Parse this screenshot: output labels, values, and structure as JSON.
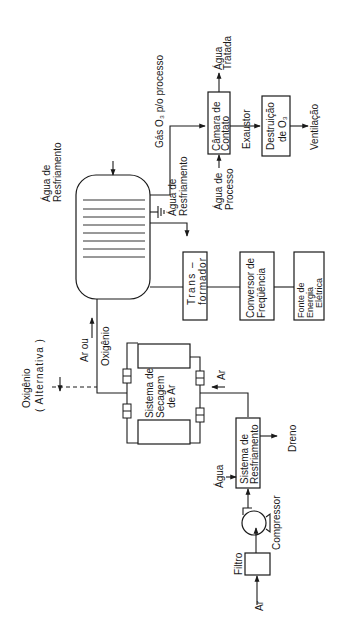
{
  "diagram": {
    "title": "",
    "orientation": "rotated-90-ccw",
    "nodes": {
      "ar_inlet": "Ar",
      "filtro": "Filtro",
      "compressor": "Compressor",
      "agua_inlet": "Água",
      "resfriamento_l1": "Sistema de",
      "resfriamento_l2": "Resfriamento",
      "dreno": "Dreno",
      "ar_flow": "Ar",
      "secagem_l1": "Sistema de",
      "secagem_l2": "Secagem",
      "secagem_l3": "de Ar",
      "oxigenio_l1": "Oxigênio",
      "oxigenio_l2": "( Alternativa )",
      "ar_ou": "Ar ou",
      "oxigenio_flow": "Oxigênio",
      "agua_resfr_in_l1": "Água de",
      "agua_resfr_in_l2": "Resfriamento",
      "agua_resfr_out_l1": "Água de",
      "agua_resfr_out_l2": "Resfriamento",
      "gas_o3": "Gás O₃ p/o processo",
      "agua_processo_l1": "Água de",
      "agua_processo_l2": "Processo",
      "camara_l1": "Câmara  de",
      "camara_l2": "Contato",
      "agua_tratada_l1": "Água",
      "agua_tratada_l2": "Tratada",
      "exaustor": "Exaustor",
      "destruicao_l1": "Destruição",
      "destruicao_l2": "de  O₃",
      "ventilacao": "Ventilação",
      "transformador_l1": "Trans –",
      "transformador_l2": "formador",
      "conversor_l1": "Conversor de",
      "conversor_l2": "Freqüência",
      "fonte_l1": "Fonte       de",
      "fonte_l2": "Energia",
      "fonte_l3": "Elétrica"
    }
  }
}
